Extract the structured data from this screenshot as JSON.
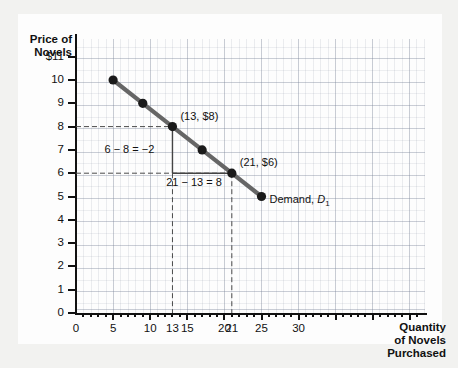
{
  "chart_data": {
    "type": "line",
    "title": "",
    "subtitle": "",
    "xlabel": "Quantity of Novels Purchased",
    "ylabel": "Price of Novels",
    "xlim": [
      0,
      47
    ],
    "ylim": [
      0,
      11.8
    ],
    "grid": true,
    "legend_position": "inline-right",
    "series": [
      {
        "name": "Demand, D1",
        "color": "#666666",
        "marker_color": "#1a1a1a",
        "x": [
          5,
          9,
          13,
          17,
          21,
          25
        ],
        "y": [
          10,
          9,
          8,
          7,
          6,
          5
        ]
      }
    ],
    "x_ticks": [
      0,
      5,
      10,
      13,
      15,
      20,
      21,
      25,
      30
    ],
    "y_ticks": [
      0,
      1,
      2,
      3,
      4,
      5,
      6,
      7,
      8,
      9,
      10,
      11
    ],
    "annotations": [
      {
        "text": "(13, $8)",
        "x": 13,
        "y": 8
      },
      {
        "text": "(21, $6)",
        "x": 21,
        "y": 6
      },
      {
        "text": "6 − 8 = −2",
        "x": 9.2,
        "y": 7
      },
      {
        "text": "21 − 13 = 8",
        "x": 17,
        "y": 5.72
      },
      {
        "text": "Demand, D1",
        "x": 25,
        "y": 5
      }
    ]
  },
  "axes": {
    "y_title_line1": "Price of",
    "y_title_line2": "Novels",
    "x_title_line1": "Quantity",
    "x_title_line2": "of Novels",
    "x_title_line3": "Purchased",
    "y_tick_labels": [
      "$11",
      "10",
      "9",
      "8",
      "7",
      "6",
      "5",
      "4",
      "3",
      "2",
      "1",
      "0"
    ],
    "x_tick_labels": [
      "0",
      "5",
      "10",
      "13",
      "15",
      "20",
      "21",
      "25",
      "30"
    ]
  },
  "labels": {
    "point_13_8": "(13, $8)",
    "point_21_6": "(21, $6)",
    "rise": "6 − 8 = −2",
    "run": "21 − 13 = 8",
    "demand_text": "Demand,",
    "demand_symbol": "D",
    "demand_subscript": "1"
  },
  "colors": {
    "curve": "#6b6b6b",
    "marker": "#161616",
    "axis": "#111111",
    "grid": "#8390a4",
    "dashed": "#4a4a4a",
    "background": "#f2f2f0",
    "plate": "#fdfdfd"
  }
}
